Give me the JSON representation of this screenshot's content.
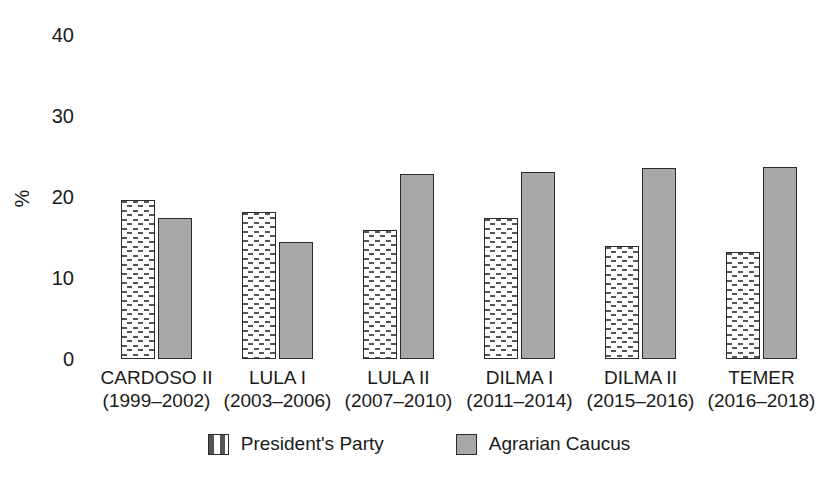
{
  "chart_data": {
    "type": "bar",
    "title": "",
    "xlabel": "",
    "ylabel": "%",
    "ylim": [
      0,
      40
    ],
    "yticks": [
      0,
      10,
      20,
      30,
      40
    ],
    "grid": false,
    "legend_position": "bottom-center",
    "categories": [
      "CARDOSO II",
      "LULA I",
      "LULA II",
      "DILMA I",
      "DILMA II",
      "TEMER"
    ],
    "category_subtitles": [
      "(1999–2002)",
      "(2003–2006)",
      "(2007–2010)",
      "(2011–2014)",
      "(2015–2016)",
      "(2016–2018)"
    ],
    "series": [
      {
        "name": "President's Party",
        "style": "hatch",
        "color": "#ffffff",
        "values": [
          19.6,
          18.1,
          15.9,
          17.4,
          14.0,
          13.2
        ]
      },
      {
        "name": "Agrarian Caucus",
        "style": "solid",
        "color": "#a8a8a8",
        "values": [
          17.4,
          14.4,
          22.8,
          23.1,
          23.6,
          23.7
        ]
      }
    ]
  },
  "axis": {
    "y_title": "%",
    "y_tick_labels": [
      "40",
      "30",
      "20",
      "10",
      "0"
    ]
  },
  "legend": {
    "items": [
      {
        "label": "President's Party",
        "style": "hatch"
      },
      {
        "label": "Agrarian Caucus",
        "style": "solid"
      }
    ]
  },
  "colors": {
    "bar_outline": "#2b2b2b",
    "solid_fill": "#a8a8a8",
    "hatch_fill": "#ffffff",
    "text": "#1a1a1a",
    "background": "#ffffff"
  }
}
